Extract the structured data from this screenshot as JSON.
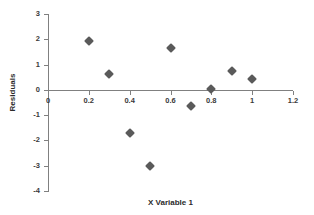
{
  "chart_data": {
    "type": "scatter",
    "title": "",
    "xlabel": "X Variable 1",
    "ylabel": "Residuals",
    "xlim": [
      0,
      1.2
    ],
    "ylim": [
      -4,
      3
    ],
    "xticks": [
      "0",
      "0.2",
      "0.4",
      "0.6",
      "0.8",
      "1",
      "1.2"
    ],
    "xtick_values": [
      0,
      0.2,
      0.4,
      0.6,
      0.8,
      1,
      1.2
    ],
    "yticks": [
      "3",
      "2",
      "1",
      "0",
      "-1",
      "-2",
      "-3",
      "-4"
    ],
    "ytick_values": [
      3,
      2,
      1,
      0,
      -1,
      -2,
      -3,
      -4
    ],
    "grid": false,
    "legend": false,
    "marker": {
      "shape": "diamond",
      "color": "#5a5a5a",
      "size": 7
    },
    "series": [
      {
        "name": "Residuals",
        "points": [
          {
            "x": 0.2,
            "y": 1.93
          },
          {
            "x": 0.3,
            "y": 0.62
          },
          {
            "x": 0.4,
            "y": -1.7
          },
          {
            "x": 0.5,
            "y": -3.0
          },
          {
            "x": 0.6,
            "y": 1.67
          },
          {
            "x": 0.7,
            "y": -0.62
          },
          {
            "x": 0.8,
            "y": 0.04
          },
          {
            "x": 0.9,
            "y": 0.74
          },
          {
            "x": 1.0,
            "y": 0.43
          }
        ]
      }
    ]
  },
  "colors": {
    "marker": "#5a5a5a",
    "axis": "#808080",
    "text": "#2b2b2b",
    "background": "#ffffff"
  }
}
